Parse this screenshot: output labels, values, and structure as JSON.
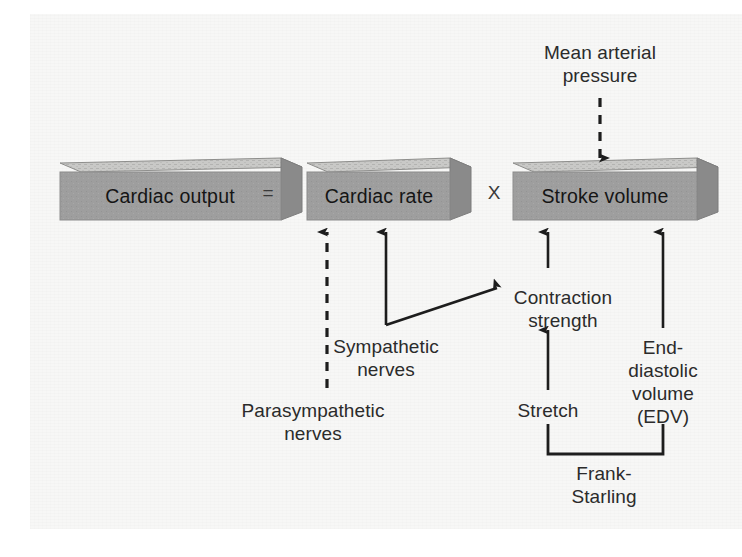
{
  "figure": {
    "background_color": "#f7f7f6",
    "box_face_color": "#9e9e9e",
    "box_top_color": "#c9c9c7",
    "box_side_color": "#8a8a8a",
    "ink_color": "#2b2b2b"
  },
  "boxes": [
    {
      "id": "cardiac-output",
      "label": "Cardiac output",
      "x": 160,
      "y": 192,
      "width": 200,
      "height": 56
    },
    {
      "id": "cardiac-rate",
      "label": "Cardiac rate",
      "x": 392,
      "y": 192,
      "width": 160,
      "height": 56
    },
    {
      "id": "stroke-volume",
      "label": "Stroke volume",
      "x": 625,
      "y": 192,
      "width": 182,
      "height": 56
    }
  ],
  "operators": [
    {
      "id": "equals",
      "symbol": "=",
      "x": 268,
      "y": 192
    },
    {
      "id": "multiply",
      "symbol": "X",
      "x": 494,
      "y": 192
    }
  ],
  "labels": [
    {
      "id": "mean-arterial-pressure",
      "text": "Mean arterial\npressure",
      "x": 600,
      "y": 41
    },
    {
      "id": "contraction-strength",
      "text": "Contraction\nstrength",
      "x": 563,
      "y": 286
    },
    {
      "id": "sympathetic-nerves",
      "text": "Sympathetic\nnerves",
      "x": 386,
      "y": 335
    },
    {
      "id": "parasympathetic-nerves",
      "text": "Parasympathetic\nnerves",
      "x": 313,
      "y": 399
    },
    {
      "id": "stretch",
      "text": "Stretch",
      "x": 548,
      "y": 399
    },
    {
      "id": "end-diastolic-volume",
      "text": "End-\ndiastolic\nvolume\n(EDV)",
      "x": 663,
      "y": 336
    },
    {
      "id": "frank-starling",
      "text": "Frank-\nStarling",
      "x": 604,
      "y": 472
    }
  ],
  "connectors": [
    {
      "id": "map-to-stroke-volume",
      "style": "dashed",
      "from": "mean-arterial-pressure",
      "to": "stroke-volume"
    },
    {
      "id": "parasympathetic-to-cardiac-rate",
      "style": "dashed",
      "from": "parasympathetic-nerves",
      "to": "cardiac-rate"
    },
    {
      "id": "sympathetic-to-cardiac-rate",
      "style": "solid",
      "from": "sympathetic-nerves",
      "to": "cardiac-rate"
    },
    {
      "id": "sympathetic-to-contraction",
      "style": "solid",
      "from": "sympathetic-nerves",
      "to": "contraction-strength"
    },
    {
      "id": "contraction-to-stroke-volume",
      "style": "solid",
      "from": "contraction-strength",
      "to": "stroke-volume"
    },
    {
      "id": "stretch-to-contraction",
      "style": "solid",
      "from": "stretch",
      "to": "contraction-strength"
    },
    {
      "id": "edv-to-stroke-volume",
      "style": "solid",
      "from": "end-diastolic-volume",
      "to": "stroke-volume"
    },
    {
      "id": "frank-starling-bracket",
      "style": "bracket",
      "from": "frank-starling",
      "to": "stretch-and-edv"
    }
  ]
}
